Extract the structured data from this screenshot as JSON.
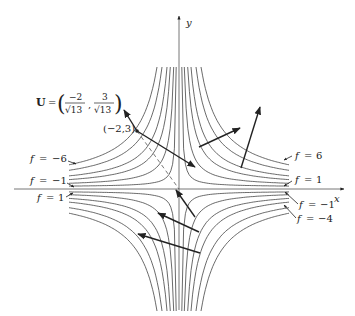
{
  "diagram": {
    "type": "level curves with gradient vectors",
    "axes": {
      "x_label": "x",
      "y_label": "y"
    },
    "unit_vector": {
      "label_U": "U",
      "equals": "=",
      "num1": "−2",
      "den1": "√13",
      "num2": "3",
      "den2": "√13"
    },
    "point_label": "(−2,3)",
    "level_labels_left": [
      {
        "f": "f",
        "eq": "=",
        "val": "−6"
      },
      {
        "f": "f",
        "eq": "=",
        "val": "−1"
      },
      {
        "f": "f",
        "eq": "=",
        "val": "1"
      }
    ],
    "level_labels_right": [
      {
        "f": "f",
        "eq": "=",
        "val": "6"
      },
      {
        "f": "f",
        "eq": "=",
        "val": "1"
      },
      {
        "f": "f",
        "eq": "=",
        "val": "−1"
      },
      {
        "f": "f",
        "eq": "=",
        "val": "−4"
      }
    ],
    "level_values": [
      -6,
      -4,
      -1,
      1,
      4,
      6
    ]
  }
}
